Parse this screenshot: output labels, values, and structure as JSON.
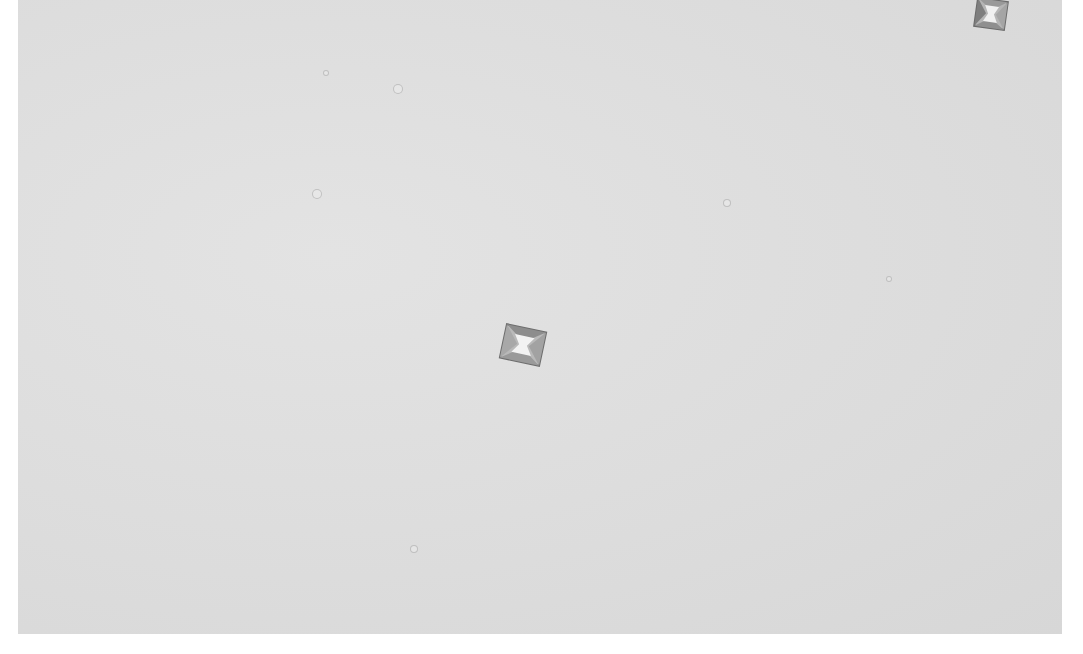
{
  "image": {
    "description": "Grayscale light micrograph showing square envelope-shaped crystals on a uniform light gray background",
    "background_color": "#dedede",
    "margin_color": "#ffffff",
    "crystals": [
      {
        "name": "crystal-center",
        "x": 497,
        "y": 322,
        "size": 46,
        "rotation": 12
      },
      {
        "name": "crystal-top-right",
        "x": 972,
        "y": -4,
        "size": 34,
        "rotation": 8
      }
    ],
    "specks": [
      {
        "x": 397,
        "y": 88,
        "r": 4
      },
      {
        "x": 316,
        "y": 193,
        "r": 4
      },
      {
        "x": 726,
        "y": 202,
        "r": 3
      },
      {
        "x": 413,
        "y": 548,
        "r": 3
      },
      {
        "x": 325,
        "y": 72,
        "r": 2
      },
      {
        "x": 888,
        "y": 278,
        "r": 2
      }
    ]
  }
}
